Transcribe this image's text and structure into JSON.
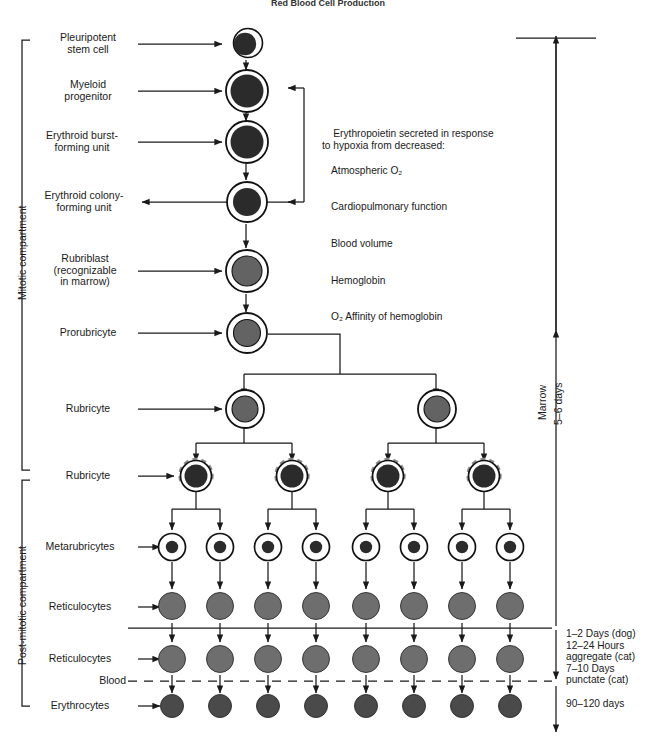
{
  "title": "Red Blood Cell Production",
  "compartments": [
    {
      "name": "mitotic",
      "label": "Mitotic compartment"
    },
    {
      "name": "post-mitotic",
      "label": "Post-mitotic compartment"
    }
  ],
  "stages": [
    {
      "id": "pleuripotent-stem-cell",
      "label": "Pleuripotent\nstem cell"
    },
    {
      "id": "myeloid-progenitor",
      "label": "Myeloid\nprogenitor"
    },
    {
      "id": "erythroid-burst-forming-unit",
      "label": "Erythroid burst-\nforming unit"
    },
    {
      "id": "erythroid-colony-forming-unit",
      "label": "Erythroid colony-\nforming unit"
    },
    {
      "id": "rubriblast",
      "label": "Rubriblast\n(recognizable\nin marrow)"
    },
    {
      "id": "prorubricyte",
      "label": "Prorubricyte"
    },
    {
      "id": "rubricyte-1",
      "label": "Rubricyte"
    },
    {
      "id": "rubricyte-2",
      "label": "Rubricyte"
    },
    {
      "id": "metarubricytes",
      "label": "Metarubricytes"
    },
    {
      "id": "reticulocytes-1",
      "label": "Reticulocytes"
    },
    {
      "id": "reticulocytes-2",
      "label": "Reticulocytes"
    },
    {
      "id": "erythrocytes",
      "label": "Erythrocytes"
    }
  ],
  "blood_line_label": "Blood",
  "erythropoietin": {
    "line1": "Erythropoietin secreted in response",
    "line2": "to hypoxia from decreased:",
    "items": [
      "Atmospheric O₂",
      "Cardiopulmonary function",
      "Blood volume",
      "Hemoglobin",
      "O₂ Affinity of hemoglobin"
    ]
  },
  "right_annotations": {
    "marrow": "Marrow",
    "marrow_duration": "5–6 days",
    "reticulocyte_notes": "1–2 Days (dog)\n12–24 Hours\naggregate (cat)\n7–10 Days\npunctate (cat)",
    "erythrocyte_lifespan": "90–120 days"
  },
  "colors": {
    "outline": "#111111",
    "nucleus_dark": "#2b2b2b",
    "nucleus_gray": "#636363",
    "reticulocyte": "#6e6e6e",
    "erythrocyte": "#4a4a4a",
    "dashed_arc": "#8c8c8c",
    "line": "#1a1a1a"
  }
}
